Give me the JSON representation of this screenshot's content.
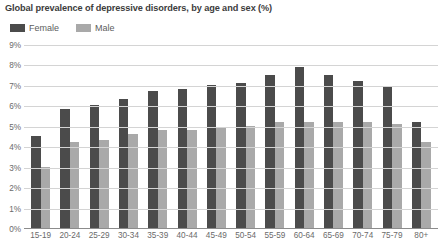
{
  "chart_data": {
    "type": "bar",
    "title": "Global prevalence of depressive disorders, by age and sex (%)",
    "xlabel": "",
    "ylabel": "",
    "ylim": [
      0,
      9
    ],
    "ytick_labels": [
      "9%",
      "8%",
      "7%",
      "6%",
      "5%",
      "4%",
      "3%",
      "2%",
      "1%",
      "0%"
    ],
    "ytick_values": [
      9,
      8,
      7,
      6,
      5,
      4,
      3,
      2,
      1,
      0
    ],
    "grid": true,
    "legend_position": "top-left",
    "categories": [
      "15-19",
      "20-24",
      "25-29",
      "30-34",
      "35-39",
      "40-44",
      "45-49",
      "50-54",
      "55-59",
      "60-64",
      "65-69",
      "70-74",
      "75-79",
      "80+"
    ],
    "series": [
      {
        "name": "Female",
        "color": "#4b4b4b",
        "values": [
          4.5,
          5.8,
          6.0,
          6.3,
          6.7,
          6.8,
          7.0,
          7.1,
          7.5,
          7.9,
          7.5,
          7.2,
          6.9,
          5.2
        ]
      },
      {
        "name": "Male",
        "color": "#a9a9a9",
        "values": [
          3.0,
          4.2,
          4.3,
          4.6,
          4.8,
          4.8,
          4.9,
          5.0,
          5.2,
          5.2,
          5.2,
          5.2,
          5.1,
          4.2
        ]
      }
    ]
  }
}
